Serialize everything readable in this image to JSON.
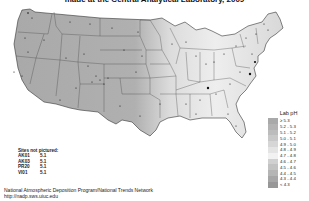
{
  "title": "made at the Central Analytical Laboratory, 2009",
  "legend": {
    "title": "Lab pH",
    "items": [
      {
        "label": "≥ 5.3",
        "color": "#a9a9a9"
      },
      {
        "label": "5.2 - 5.3",
        "color": "#b3b3b3"
      },
      {
        "label": "5.1 - 5.2",
        "color": "#bcbcbc"
      },
      {
        "label": "5.0 - 5.1",
        "color": "#c8c8c8"
      },
      {
        "label": "4.9 - 5.0",
        "color": "#d6d6d6"
      },
      {
        "label": "4.8 - 4.9",
        "color": "#e4e4e4"
      },
      {
        "label": "4.7 - 4.8",
        "color": "#f2f2f2"
      },
      {
        "label": "4.6 - 4.7",
        "color": "#d0d0d0"
      },
      {
        "label": "4.5 - 4.6",
        "color": "#c2c2c2"
      },
      {
        "label": "4.4 - 4.5",
        "color": "#b5b5b5"
      },
      {
        "label": "4.3 - 4.4",
        "color": "#a6a6a6"
      },
      {
        "label": "< 4.3",
        "color": "#979797"
      }
    ]
  },
  "sites_not_pictured": {
    "title": "Sites not pictured:",
    "rows": [
      {
        "id": "AK01",
        "value": "5.1"
      },
      {
        "id": "AK03",
        "value": "5.1"
      },
      {
        "id": "PR20",
        "value": "5.1"
      },
      {
        "id": "VI01",
        "value": "5.1"
      }
    ]
  },
  "footer": {
    "line1": "National Atmospheric Deposition Program/National Trends Network",
    "line2": "http://nadp.sws.uiuc.edu"
  },
  "map": {
    "region": "Contiguous United States",
    "fill_west": "#a8a8a8",
    "fill_east_light": "#e6e6e6",
    "border_color": "#333333",
    "site_marker_color": "#111111"
  }
}
